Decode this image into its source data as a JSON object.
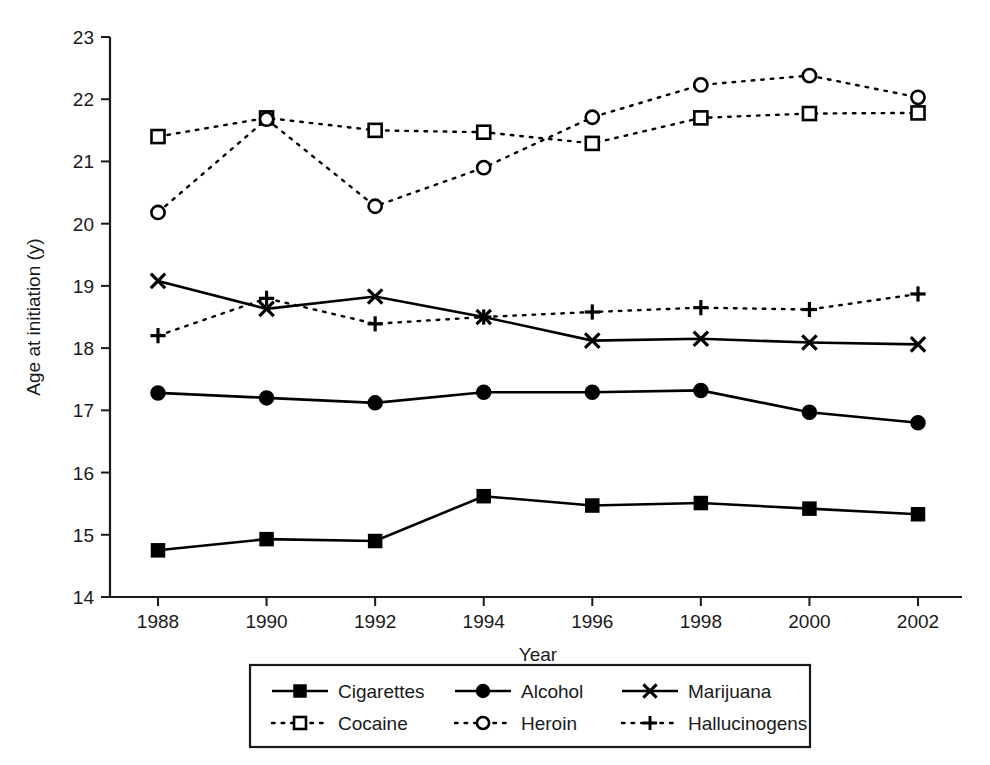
{
  "chart_data": {
    "type": "line",
    "title": "",
    "xlabel": "Year",
    "ylabel": "Age at initiation (y)",
    "categories": [
      1988,
      1990,
      1992,
      1994,
      1996,
      1998,
      2000,
      2002
    ],
    "x_tick_labels": [
      "1988",
      "1990",
      "1992",
      "1994",
      "1996",
      "1998",
      "2000",
      "2002"
    ],
    "y_tick_labels": [
      "14",
      "15",
      "16",
      "17",
      "18",
      "19",
      "20",
      "21",
      "22",
      "23"
    ],
    "xlim": [
      1987,
      2003
    ],
    "ylim": [
      14,
      23
    ],
    "grid": false,
    "legend_position": "bottom-outside",
    "series": [
      {
        "name": "Cigarettes",
        "marker": "filled-square",
        "line_style": "solid",
        "color": "#000000",
        "values": [
          14.75,
          14.93,
          14.9,
          15.62,
          15.47,
          15.51,
          15.42,
          15.33
        ]
      },
      {
        "name": "Alcohol",
        "marker": "filled-circle",
        "line_style": "solid",
        "color": "#000000",
        "values": [
          17.28,
          17.2,
          17.12,
          17.29,
          17.29,
          17.32,
          16.97,
          16.8
        ]
      },
      {
        "name": "Marijuana",
        "marker": "cross-x",
        "line_style": "solid",
        "color": "#000000",
        "values": [
          19.08,
          18.63,
          18.83,
          18.5,
          18.12,
          18.15,
          18.09,
          18.06
        ]
      },
      {
        "name": "Cocaine",
        "marker": "open-square",
        "line_style": "dotted",
        "color": "#000000",
        "values": [
          21.4,
          21.7,
          21.5,
          21.47,
          21.29,
          21.7,
          21.77,
          21.78
        ]
      },
      {
        "name": "Heroin",
        "marker": "open-circle",
        "line_style": "dotted",
        "color": "#000000",
        "values": [
          20.18,
          21.68,
          20.28,
          20.9,
          21.71,
          22.23,
          22.38,
          22.03
        ]
      },
      {
        "name": "Hallucinogens",
        "marker": "plus",
        "line_style": "dotted",
        "color": "#000000",
        "values": [
          18.2,
          18.8,
          18.39,
          18.5,
          18.58,
          18.65,
          18.62,
          18.87
        ]
      }
    ]
  }
}
